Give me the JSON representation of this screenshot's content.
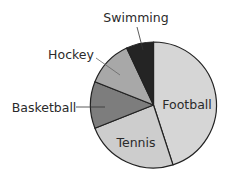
{
  "chart_data": {
    "type": "pie",
    "title": "",
    "start_angle_deg": 0,
    "direction": "clockwise",
    "categories": [
      "Football",
      "Tennis",
      "Basketball",
      "Hockey",
      "Swimming"
    ],
    "values": [
      45,
      24,
      12,
      12,
      7
    ],
    "units": "percent (estimated from slice angles)",
    "colors": [
      "#d6d6d6",
      "#cdcdcd",
      "#7d7d7d",
      "#a8a8a8",
      "#242424"
    ],
    "outline_color": "#222222",
    "labels": {
      "inside": [
        "Football",
        "Tennis"
      ],
      "outside_with_leader": [
        "Basketball",
        "Hockey",
        "Swimming"
      ]
    },
    "legend": "none",
    "grid": false
  },
  "labels": {
    "football": "Football",
    "tennis": "Tennis",
    "basketball": "Basketball",
    "hockey": "Hockey",
    "swimming": "Swimming"
  }
}
